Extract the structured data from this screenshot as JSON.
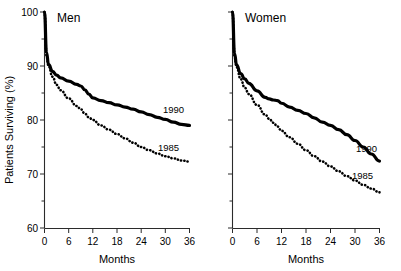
{
  "figure": {
    "ylabel": "Patients Surviving (%)",
    "xlabel_left": "Months",
    "xlabel_right": "Months"
  },
  "panels": {
    "left": {
      "title": "Men",
      "series_label_1990": "1990",
      "series_label_1985": "1985"
    },
    "right": {
      "title": "Women",
      "series_label_1990": "1990",
      "series_label_1985": "1985"
    }
  },
  "ticks": {
    "y_labels": [
      "100",
      "90",
      "80",
      "70",
      "60"
    ],
    "y_values": [
      100,
      90,
      80,
      70,
      60
    ],
    "x_labels": [
      "0",
      "6",
      "12",
      "18",
      "24",
      "30",
      "36"
    ],
    "x_values": [
      0,
      6,
      12,
      18,
      24,
      30,
      36
    ]
  },
  "chart_data": [
    {
      "type": "line",
      "title": "Men",
      "xlabel": "Months",
      "ylabel": "Patients Surviving (%)",
      "xlim": [
        0,
        36
      ],
      "ylim": [
        60,
        100
      ],
      "xticks": [
        0,
        6,
        12,
        18,
        24,
        30,
        36
      ],
      "yticks": [
        60,
        70,
        80,
        90,
        100
      ],
      "grid": false,
      "legend_position": "inline-right-of-curve",
      "series": [
        {
          "name": "1990",
          "style": "solid",
          "x": [
            0,
            0.5,
            1,
            2,
            3,
            4,
            6,
            8,
            9,
            10,
            11,
            12,
            14,
            16,
            18,
            20,
            22,
            24,
            26,
            28,
            30,
            32,
            34,
            36
          ],
          "values": [
            100.0,
            92.5,
            90.3,
            89.0,
            88.3,
            87.8,
            87.2,
            86.6,
            86.3,
            85.6,
            84.8,
            84.1,
            83.6,
            83.2,
            82.8,
            82.4,
            82.0,
            81.5,
            81.0,
            80.5,
            80.1,
            79.6,
            79.2,
            79.0
          ]
        },
        {
          "name": "1985",
          "style": "dotted",
          "x": [
            0,
            0.5,
            1,
            2,
            3,
            4,
            6,
            8,
            9,
            10,
            11,
            12,
            14,
            16,
            18,
            20,
            22,
            24,
            26,
            28,
            30,
            32,
            34,
            36
          ],
          "values": [
            100.0,
            92.0,
            90.0,
            88.0,
            86.5,
            85.5,
            84.0,
            82.6,
            82.0,
            81.2,
            80.5,
            80.0,
            79.0,
            78.2,
            77.4,
            76.6,
            75.8,
            75.0,
            74.4,
            73.8,
            73.3,
            72.9,
            72.5,
            72.3
          ]
        }
      ],
      "label_positions": [
        {
          "name": "1990",
          "x": 28.5,
          "y": 81.5
        },
        {
          "name": "1985",
          "x": 27.5,
          "y": 74.6
        }
      ]
    },
    {
      "type": "line",
      "title": "Women",
      "xlabel": "Months",
      "ylabel": "Patients Surviving (%)",
      "xlim": [
        0,
        36
      ],
      "ylim": [
        60,
        100
      ],
      "xticks": [
        0,
        6,
        12,
        18,
        24,
        30,
        36
      ],
      "yticks": [
        60,
        70,
        80,
        90,
        100
      ],
      "grid": false,
      "y_tick_labels_visible": false,
      "legend_position": "inline-right-of-curve",
      "series": [
        {
          "name": "1990",
          "style": "solid",
          "x": [
            0,
            0.5,
            1,
            2,
            3,
            4,
            6,
            8,
            9,
            10,
            11,
            12,
            14,
            16,
            18,
            20,
            22,
            24,
            26,
            28,
            30,
            32,
            34,
            36
          ],
          "values": [
            100.0,
            92.3,
            90.2,
            88.6,
            87.6,
            86.8,
            85.4,
            84.2,
            83.9,
            83.7,
            83.6,
            83.1,
            82.4,
            81.8,
            81.2,
            80.4,
            79.6,
            79.0,
            78.2,
            77.3,
            76.2,
            75.0,
            73.7,
            72.4
          ]
        },
        {
          "name": "1985",
          "style": "dotted",
          "x": [
            0,
            0.5,
            1,
            2,
            3,
            4,
            6,
            8,
            9,
            10,
            11,
            12,
            14,
            16,
            18,
            20,
            22,
            24,
            26,
            28,
            30,
            32,
            34,
            36
          ],
          "values": [
            100.0,
            91.8,
            89.8,
            87.6,
            86.0,
            84.8,
            82.8,
            81.0,
            80.2,
            79.5,
            78.8,
            78.0,
            76.8,
            75.6,
            74.4,
            73.3,
            72.3,
            71.4,
            70.5,
            69.6,
            68.8,
            68.0,
            67.3,
            66.6
          ]
        }
      ],
      "label_positions": [
        {
          "name": "1990",
          "x": 29.5,
          "y": 76.6
        },
        {
          "name": "1985",
          "x": 29.0,
          "y": 70.3
        }
      ]
    }
  ]
}
